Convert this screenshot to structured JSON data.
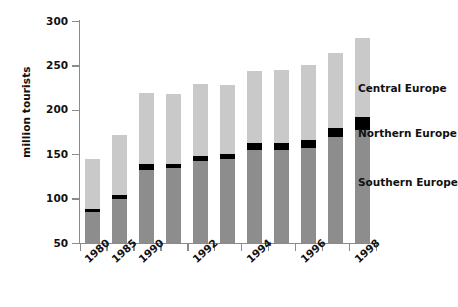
{
  "chart_data": {
    "type": "bar",
    "stacked": true,
    "title": "",
    "xlabel": "",
    "ylabel": "million tourists",
    "ylim": [
      50,
      300
    ],
    "yticks": [
      50,
      100,
      150,
      200,
      250,
      300
    ],
    "grid": false,
    "legend_position": "right",
    "categories": [
      "1980",
      "1985",
      "1990",
      "1991",
      "1992",
      "1993",
      "1994",
      "1995",
      "1996",
      "1997",
      "1998"
    ],
    "visible_tick_labels": [
      "1980",
      "1985",
      "1990",
      "",
      "1992",
      "",
      "1994",
      "",
      "1996",
      "",
      "1998"
    ],
    "series": [
      {
        "name": "Southern Europe",
        "color": "#8d8d8d",
        "values": [
          85,
          100,
          133,
          135,
          143,
          145,
          155,
          155,
          158,
          170,
          178
        ]
      },
      {
        "name": "Northern Europe",
        "color": "#000000",
        "values": [
          4,
          5,
          6,
          5,
          6,
          6,
          8,
          8,
          9,
          10,
          14
        ]
      },
      {
        "name": "Central Europe",
        "color": "#c9c9c9",
        "values": [
          56,
          67,
          81,
          78,
          81,
          78,
          81,
          82,
          84,
          85,
          89
        ]
      }
    ],
    "totals": [
      145,
      172,
      220,
      218,
      230,
      229,
      244,
      245,
      251,
      265,
      281
    ],
    "cumulative_tops": {
      "southern": [
        85,
        100,
        133,
        135,
        143,
        145,
        155,
        155,
        158,
        170,
        178
      ],
      "northern": [
        89,
        105,
        139,
        140,
        149,
        151,
        163,
        163,
        167,
        180,
        192
      ],
      "central": [
        145,
        172,
        220,
        218,
        230,
        229,
        244,
        245,
        251,
        265,
        281
      ]
    }
  },
  "legend": {
    "items": [
      {
        "label": "Central Europe",
        "color": "#c9c9c9"
      },
      {
        "label": "Northern Europe",
        "color": "#000000"
      },
      {
        "label": "Southern Europe",
        "color": "#8d8d8d"
      }
    ]
  },
  "axis": {
    "y_title": "million tourists"
  }
}
